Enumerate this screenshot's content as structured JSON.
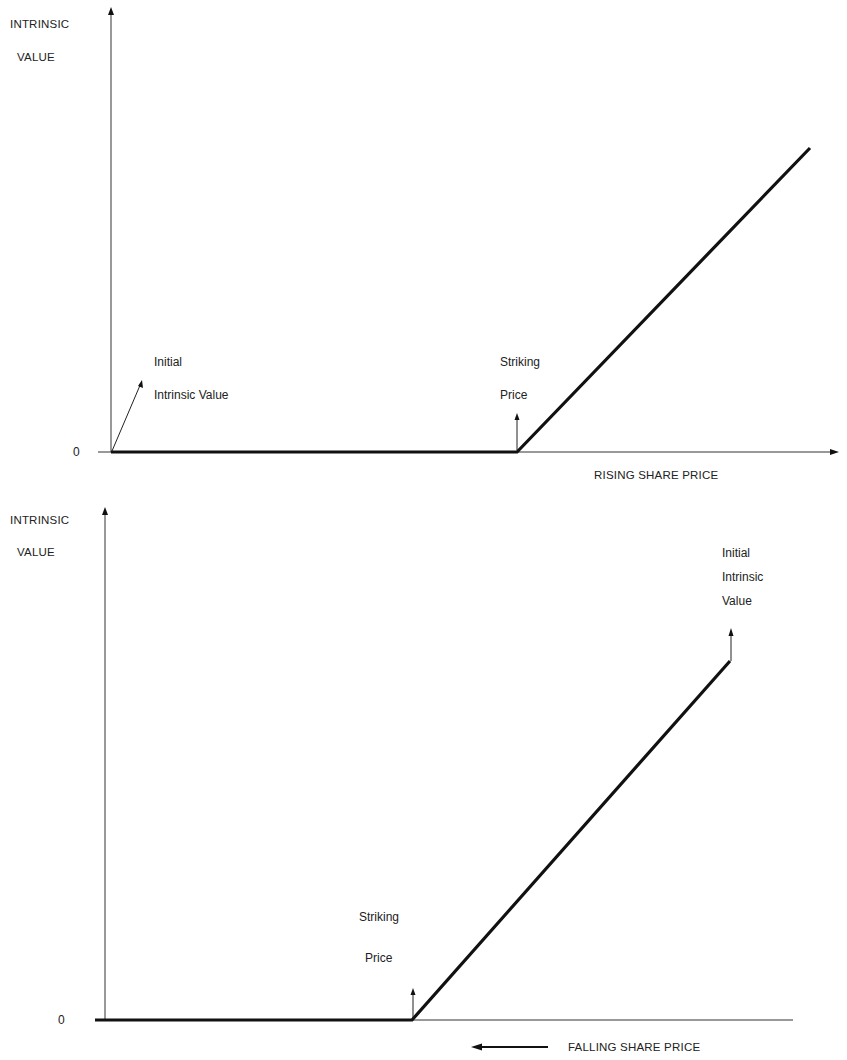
{
  "top_diagram": {
    "y_axis_label_line1": "INTRINSIC",
    "y_axis_label_line2": "VALUE",
    "zero_label": "0",
    "x_axis_label": "RISING SHARE PRICE",
    "initial_label_line1": "Initial",
    "initial_label_line2": "Intrinsic Value",
    "strike_label_line1": "Striking",
    "strike_label_line2": "Price"
  },
  "bottom_diagram": {
    "y_axis_label_line1": "INTRINSIC",
    "y_axis_label_line2": "VALUE",
    "zero_label": "0",
    "x_axis_label": "FALLING SHARE PRICE",
    "initial_label_line1": "Initial",
    "initial_label_line2": "Intrinsic",
    "initial_label_line3": "Value",
    "strike_label_line1": "Striking",
    "strike_label_line2": "Price"
  },
  "colors": {
    "line": "#111111",
    "axis": "#333333",
    "background": "#ffffff"
  }
}
